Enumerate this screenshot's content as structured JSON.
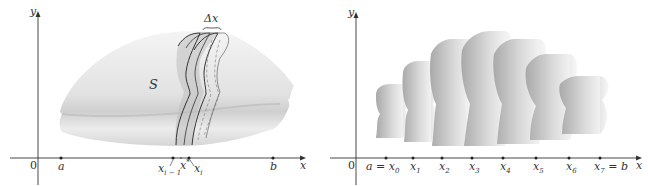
{
  "left_figure": {
    "axes": {
      "x_label": "x",
      "y_label": "y",
      "origin_label": "0"
    },
    "solid_label": "S",
    "slab_width_label": "Δx",
    "points": [
      {
        "name": "a",
        "label": "a"
      },
      {
        "name": "x_i_minus_1",
        "label": "x",
        "sub": "i − 1"
      },
      {
        "name": "x_i_star",
        "label": "x",
        "sub": "i",
        "sup": "*"
      },
      {
        "name": "x_i",
        "label": "x",
        "sub": "i"
      },
      {
        "name": "b",
        "label": "b"
      }
    ]
  },
  "right_figure": {
    "axes": {
      "x_label": "x",
      "y_label": "y",
      "origin_label": "0"
    },
    "points": [
      {
        "label": "a = x",
        "sub": "0"
      },
      {
        "label": "x",
        "sub": "1"
      },
      {
        "label": "x",
        "sub": "2"
      },
      {
        "label": "x",
        "sub": "3"
      },
      {
        "label": "x",
        "sub": "4"
      },
      {
        "label": "x",
        "sub": "5"
      },
      {
        "label": "x",
        "sub": "6"
      },
      {
        "label": "x",
        "sub": "7",
        "suffix": " = b"
      }
    ],
    "slab_count": 7
  },
  "colors": {
    "axis": "#333333",
    "solid_light": "#eeeeee",
    "solid_mid": "#c8c8c8",
    "solid_dark": "#9a9a9a",
    "outline": "#333333"
  }
}
